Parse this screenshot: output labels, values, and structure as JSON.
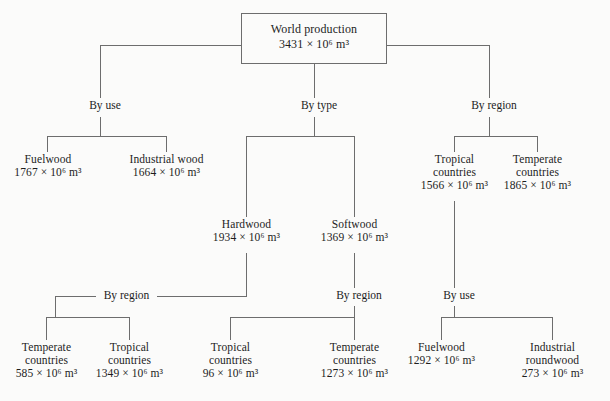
{
  "diagram": {
    "type": "tree",
    "unit_mantissa": " × 10",
    "unit_exponent": "6",
    "unit_suffix": " m",
    "unit_suffix_exponent": "3",
    "root": {
      "label": "World production",
      "value": "3431",
      "value_text": "3431 × 10⁶ m³"
    },
    "edge_labels": {
      "by_use_top": "By use",
      "by_type_top": "By type",
      "by_region_top": "By region",
      "hardwood_by_region": "By region",
      "softwood_by_region": "By region",
      "tropical_by_use": "By use"
    },
    "nodes": {
      "fuelwood_top": {
        "line1": "Fuelwood",
        "line2": "",
        "value": "1767",
        "value_text": "1767 × 10⁶ m³"
      },
      "industrial_wood_top": {
        "line1": "Industrial wood",
        "line2": "",
        "value": "1664",
        "value_text": "1664 × 10⁶ m³"
      },
      "tropical_countries_top": {
        "line1": "Tropical",
        "line2": "countries",
        "value": "1566",
        "value_text": "1566 × 10⁶ m³"
      },
      "temperate_countries_top": {
        "line1": "Temperate",
        "line2": "countries",
        "value": "1865",
        "value_text": "1865 × 10⁶ m³"
      },
      "hardwood": {
        "line1": "Hardwood",
        "line2": "",
        "value": "1934",
        "value_text": "1934 × 10⁶ m³"
      },
      "softwood": {
        "line1": "Softwood",
        "line2": "",
        "value": "1369",
        "value_text": "1369 × 10⁶ m³"
      },
      "hw_temperate": {
        "line1": "Temperate",
        "line2": "countries",
        "value": "585",
        "value_text": "585 × 10⁶ m³"
      },
      "hw_tropical": {
        "line1": "Tropical",
        "line2": "countries",
        "value": "1349",
        "value_text": "1349 × 10⁶ m³"
      },
      "sw_tropical": {
        "line1": "Tropical",
        "line2": "countries",
        "value": "96",
        "value_text": "96 × 10⁶ m³"
      },
      "sw_temperate": {
        "line1": "Temperate",
        "line2": "countries",
        "value": "1273",
        "value_text": "1273 × 10⁶ m³"
      },
      "trop_fuelwood": {
        "line1": "Fuelwood",
        "line2": "",
        "value": "1292",
        "value_text": "1292 × 10⁶ m³"
      },
      "trop_industrial_roundwood": {
        "line1": "Industrial",
        "line2": "roundwood",
        "value": "273",
        "value_text": "273 × 10⁶ m³"
      }
    },
    "colors": {
      "background": "#fbfbfa",
      "line": "#6d6d6d",
      "text": "#1d1d1d"
    }
  }
}
